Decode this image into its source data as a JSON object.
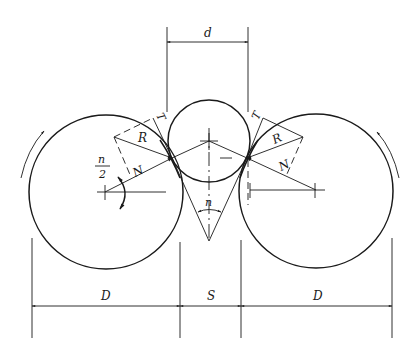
{
  "diagram": {
    "labels": {
      "d": "d",
      "D_left": "D",
      "S": "S",
      "D_right": "D",
      "R_left": "R",
      "R_right": "R",
      "N_left": "N",
      "N_right": "N",
      "T_left": "T",
      "T_right": "T",
      "n_angle": "n",
      "half_angle_num": "n",
      "half_angle_den": "2"
    },
    "components": [
      {
        "name": "left-roll",
        "shape": "circle",
        "cx": 106,
        "cy": 192,
        "r": 77
      },
      {
        "name": "workpiece",
        "shape": "circle",
        "cx": 209,
        "cy": 141,
        "r": 41
      },
      {
        "name": "right-roll",
        "shape": "circle",
        "cx": 316,
        "cy": 191,
        "r": 77
      }
    ],
    "dimensions": [
      {
        "label": "d",
        "from_x": 167,
        "to_x": 248,
        "y": 42
      },
      {
        "label": "D",
        "from_x": 32,
        "to_x": 180,
        "y": 306
      },
      {
        "label": "S",
        "from_x": 180,
        "to_x": 241,
        "y": 306
      },
      {
        "label": "D",
        "from_x": 241,
        "to_x": 392,
        "y": 306
      }
    ],
    "rotation": {
      "left": "counterclockwise-up",
      "right": "clockwise-up"
    },
    "colors": {
      "line": "#1a1a1a",
      "background": "#ffffff"
    }
  }
}
